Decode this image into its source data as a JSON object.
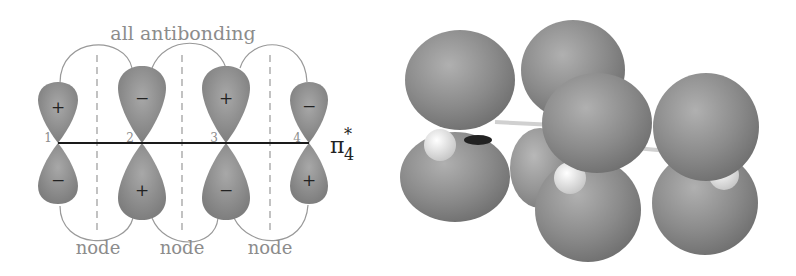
{
  "left_diagram": {
    "title": "all antibonding",
    "orbital_label": "π",
    "orbital_sup": "*",
    "orbital_sub": "4",
    "atoms": [
      {
        "num": "1",
        "top_sign": "+",
        "bottom_sign": "−",
        "size": "small"
      },
      {
        "num": "2",
        "top_sign": "−",
        "bottom_sign": "+",
        "size": "large"
      },
      {
        "num": "3",
        "top_sign": "+",
        "bottom_sign": "−",
        "size": "large"
      },
      {
        "num": "4",
        "top_sign": "−",
        "bottom_sign": "+",
        "size": "small"
      }
    ],
    "node_labels": [
      "node",
      "node",
      "node"
    ],
    "colors": {
      "lobe": "#8a8a8a",
      "lobe_highlight": "#b5b5b5",
      "axis": "#1a1a1a",
      "node_line": "#999999",
      "text_gray": "#8c8c8c",
      "text_dark": "#222222"
    }
  },
  "right_diagram": {
    "description": "3D rendered pi-star-4 molecular orbital lobes of butadiene",
    "colors": {
      "lobe": "#8c8c8c",
      "hydrogen": "#e6e6e6"
    }
  }
}
